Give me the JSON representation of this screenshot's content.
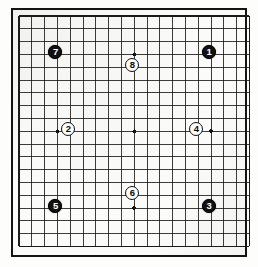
{
  "figure": {
    "kind": "go-board-diagram",
    "board_size": 19,
    "title": ""
  },
  "board": {
    "size": 19,
    "columns": 19,
    "rows": 19,
    "line_color": "#1a1a1a",
    "border_color": "#141414",
    "background_color": "#fbfbf9",
    "star_point_color": "#141414",
    "star_points": [
      {
        "col": 4,
        "row": 4
      },
      {
        "col": 10,
        "row": 4
      },
      {
        "col": 16,
        "row": 4
      },
      {
        "col": 4,
        "row": 10
      },
      {
        "col": 10,
        "row": 10
      },
      {
        "col": 16,
        "row": 10
      },
      {
        "col": 4,
        "row": 16
      },
      {
        "col": 10,
        "row": 16
      },
      {
        "col": 16,
        "row": 16
      }
    ]
  },
  "geometry": {
    "origin_x": 17,
    "origin_y": 14,
    "cell": 12.8,
    "stone_diameter": 14,
    "star_radius": 1.9,
    "frame_left": 11,
    "frame_top": 8,
    "frame_width": 236,
    "frame_height": 249
  },
  "stones": [
    {
      "label": "1",
      "color": "black",
      "col": 16,
      "row": 4
    },
    {
      "label": "2",
      "color": "white",
      "col": 5,
      "row": 10
    },
    {
      "label": "3",
      "color": "black",
      "col": 16,
      "row": 16
    },
    {
      "label": "4",
      "color": "white",
      "col": 15,
      "row": 10
    },
    {
      "label": "5",
      "color": "black",
      "col": 4,
      "row": 16
    },
    {
      "label": "6",
      "color": "white",
      "col": 10,
      "row": 15
    },
    {
      "label": "7",
      "color": "black",
      "col": 4,
      "row": 4
    },
    {
      "label": "8",
      "color": "white",
      "col": 10,
      "row": 5
    }
  ],
  "colors": {
    "black_stone": "#111111",
    "white_stone": "#fcfcfa",
    "black_stone_text": "#ffffff",
    "white_stone_text": "#0a0a0a",
    "page_background": "#ffffff"
  }
}
